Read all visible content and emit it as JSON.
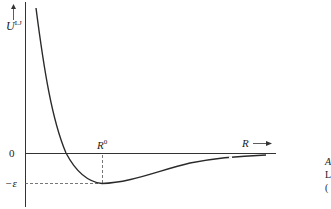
{
  "diagram": {
    "y_axis": {
      "label": "U",
      "label_superscript": "LJ"
    },
    "x_axis": {
      "label": "R",
      "arrow": "→"
    },
    "tick_labels": {
      "zero": "0",
      "minus_epsilon": "−ε",
      "r0": "R",
      "r0_superscript": "0"
    },
    "side_caption": {
      "line1": "A",
      "line2": "L",
      "line3": "("
    },
    "colors": {
      "curve": "#2a2a2a",
      "axis": "#333333",
      "dashed": "#555555"
    }
  }
}
